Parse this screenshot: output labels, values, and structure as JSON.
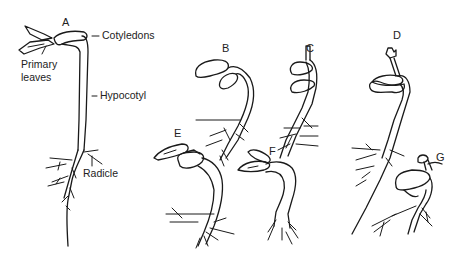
{
  "diagram": {
    "seedlings": [
      {
        "id": "A",
        "label": "A"
      },
      {
        "id": "B",
        "label": "B"
      },
      {
        "id": "C",
        "label": "C"
      },
      {
        "id": "D",
        "label": "D"
      },
      {
        "id": "E",
        "label": "E"
      },
      {
        "id": "F",
        "label": "F"
      },
      {
        "id": "G",
        "label": "G"
      }
    ],
    "annotations": {
      "cotyledons": "Cotyledons",
      "primary_leaves_line1": "Primary",
      "primary_leaves_line2": "leaves",
      "hypocotyl": "Hypocotyl",
      "radicle": "Radicle"
    },
    "colors": {
      "line": "#1a1a1a",
      "text": "#222222",
      "background": "#ffffff"
    }
  }
}
